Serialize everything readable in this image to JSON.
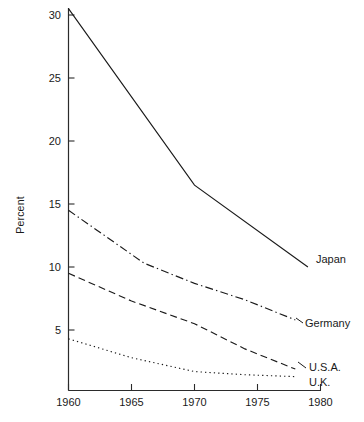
{
  "chart_data": {
    "type": "line",
    "title": "",
    "subtitle": "",
    "xlabel": "",
    "ylabel": "Percent",
    "xlim": [
      1960,
      1980
    ],
    "ylim": [
      0,
      31
    ],
    "grid": false,
    "legend_position": "right-inline-labels",
    "x_ticks": [
      1960,
      1965,
      1970,
      1975,
      1980
    ],
    "x_tick_labels": [
      "1960",
      "1965",
      "1970",
      "1975",
      "1980"
    ],
    "y_ticks": [
      5,
      10,
      15,
      20,
      25,
      30
    ],
    "y_tick_labels": [
      "5",
      "10",
      "15",
      "20",
      "25",
      "30"
    ],
    "series": [
      {
        "name": "Japan",
        "line_style": "solid",
        "color": "#1a1a1a",
        "x": [
          1960,
          1970,
          1979
        ],
        "values": [
          30.5,
          16.5,
          10.0
        ],
        "label_x": 1980.2,
        "label_y": 11.0
      },
      {
        "name": "Germany",
        "line_style": "dash-dot",
        "color": "#1a1a1a",
        "x": [
          1960,
          1963,
          1966,
          1970,
          1974,
          1978
        ],
        "values": [
          14.5,
          12.4,
          10.3,
          8.7,
          7.4,
          5.8
        ],
        "label_x": 1980.2,
        "label_y": 5.6
      },
      {
        "name": "U.S.A.",
        "line_style": "dashed",
        "color": "#1a1a1a",
        "x": [
          1960,
          1965,
          1970,
          1974,
          1978
        ],
        "values": [
          9.5,
          7.3,
          5.5,
          3.5,
          1.9
        ],
        "label_x": 1980.2,
        "label_y": 2.3
      },
      {
        "name": "U.K.",
        "line_style": "dotted",
        "color": "#1a1a1a",
        "x": [
          1960,
          1965,
          1970,
          1974,
          1978
        ],
        "values": [
          4.3,
          2.8,
          1.7,
          1.45,
          1.3
        ],
        "label_x": 1980.2,
        "label_y": 0.6
      }
    ]
  },
  "axis": {
    "y_title": "Percent"
  },
  "labels": {
    "japan": "Japan",
    "germany": "Germany",
    "usa": "U.S.A.",
    "uk": "U.K."
  },
  "y_tick_labels": {
    "t30": "30",
    "t25": "25",
    "t20": "20",
    "t15": "15",
    "t10": "10",
    "t5": "5"
  },
  "x_tick_labels": {
    "t1960": "1960",
    "t1965": "1965",
    "t1970": "1970",
    "t1975": "1975",
    "t1980": "1980"
  }
}
